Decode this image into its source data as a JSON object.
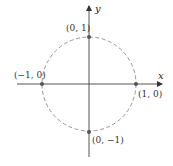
{
  "diagram": {
    "axes": {
      "x_label": "x",
      "y_label": "y"
    },
    "points": [
      {
        "label": "(0, 1)",
        "x": 0,
        "y": 1
      },
      {
        "label": "(−1, 0)",
        "x": -1,
        "y": 0
      },
      {
        "label": "(1, 0)",
        "x": 1,
        "y": 0
      },
      {
        "label": "(0, −1)",
        "x": 0,
        "y": -1
      }
    ],
    "circle": {
      "radius": 1,
      "style": "dashed"
    },
    "colors": {
      "axis": "#555555",
      "circle": "#888888",
      "point": "#555555",
      "text": "#333333"
    }
  }
}
